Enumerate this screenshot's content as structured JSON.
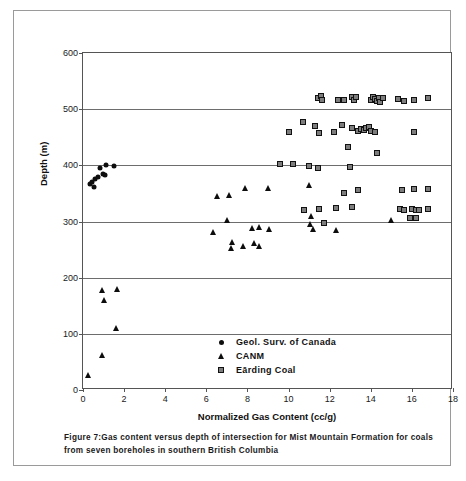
{
  "chart_data": {
    "type": "scatter",
    "title": "",
    "xlabel": "Normalized Gas Content (cc/g)",
    "ylabel": "Depth (m)",
    "xlim": [
      0,
      18
    ],
    "ylim": [
      0,
      600
    ],
    "xticks": [
      0,
      2,
      4,
      6,
      8,
      10,
      12,
      14,
      16,
      18
    ],
    "yticks": [
      0,
      100,
      200,
      300,
      400,
      500,
      600
    ],
    "grid": "horizontal",
    "legend_position": "inside-lower-center",
    "series": [
      {
        "name": "Geol. Surv. of Canada",
        "marker": "circle",
        "color": "#0d0d0d",
        "points": [
          [
            0.35,
            366
          ],
          [
            0.45,
            371
          ],
          [
            0.55,
            362
          ],
          [
            0.6,
            375
          ],
          [
            0.75,
            380
          ],
          [
            0.85,
            396
          ],
          [
            0.95,
            385
          ],
          [
            1.05,
            383
          ],
          [
            1.1,
            401
          ],
          [
            1.5,
            399
          ]
        ]
      },
      {
        "name": "CANM",
        "marker": "triangle",
        "color": "#0d0d0d",
        "points": [
          [
            0.25,
            27
          ],
          [
            0.9,
            62
          ],
          [
            0.9,
            178
          ],
          [
            1.0,
            161
          ],
          [
            1.65,
            180
          ],
          [
            1.6,
            110
          ],
          [
            6.5,
            346
          ],
          [
            6.3,
            282
          ],
          [
            7.1,
            347
          ],
          [
            7.0,
            302
          ],
          [
            7.2,
            253
          ],
          [
            7.25,
            263
          ],
          [
            7.9,
            360
          ],
          [
            7.8,
            256
          ],
          [
            8.2,
            289
          ],
          [
            8.3,
            262
          ],
          [
            8.55,
            290
          ],
          [
            8.55,
            256
          ],
          [
            9.0,
            360
          ],
          [
            9.05,
            286
          ],
          [
            11.0,
            365
          ],
          [
            11.1,
            310
          ],
          [
            11.05,
            296
          ],
          [
            11.2,
            286
          ],
          [
            12.3,
            285
          ],
          [
            15.0,
            303
          ]
        ]
      },
      {
        "name": "Eārding Coal",
        "marker": "square",
        "color": "#7d7d7d",
        "points": [
          [
            9.6,
            403
          ],
          [
            10.2,
            403
          ],
          [
            11.0,
            399
          ],
          [
            11.45,
            396
          ],
          [
            13.0,
            397
          ],
          [
            10.0,
            459
          ],
          [
            10.7,
            477
          ],
          [
            11.3,
            470
          ],
          [
            11.5,
            458
          ],
          [
            12.2,
            459
          ],
          [
            12.6,
            471
          ],
          [
            13.1,
            467
          ],
          [
            13.4,
            461
          ],
          [
            13.5,
            465
          ],
          [
            13.65,
            463
          ],
          [
            13.75,
            466
          ],
          [
            13.9,
            468
          ],
          [
            14.0,
            462
          ],
          [
            14.2,
            459
          ],
          [
            16.1,
            460
          ],
          [
            12.9,
            432
          ],
          [
            14.3,
            422
          ],
          [
            11.45,
            520
          ],
          [
            11.6,
            523
          ],
          [
            11.65,
            516
          ],
          [
            12.4,
            516
          ],
          [
            12.7,
            517
          ],
          [
            13.1,
            522
          ],
          [
            13.2,
            516
          ],
          [
            13.3,
            521
          ],
          [
            14.0,
            516
          ],
          [
            14.1,
            522
          ],
          [
            14.2,
            518
          ],
          [
            14.3,
            514
          ],
          [
            14.4,
            520
          ],
          [
            14.45,
            512
          ],
          [
            14.6,
            519
          ],
          [
            15.3,
            518
          ],
          [
            15.6,
            514
          ],
          [
            16.1,
            517
          ],
          [
            16.8,
            519
          ],
          [
            10.75,
            320
          ],
          [
            11.5,
            323
          ],
          [
            12.3,
            324
          ],
          [
            13.1,
            325
          ],
          [
            12.7,
            350
          ],
          [
            13.4,
            356
          ],
          [
            11.7,
            297
          ],
          [
            15.5,
            356
          ],
          [
            16.1,
            357
          ],
          [
            16.8,
            357
          ],
          [
            15.4,
            322
          ],
          [
            15.6,
            320
          ],
          [
            16.0,
            322
          ],
          [
            16.2,
            321
          ],
          [
            16.35,
            320
          ],
          [
            16.8,
            323
          ],
          [
            15.9,
            306
          ],
          [
            16.2,
            306
          ]
        ]
      }
    ],
    "caption": "Figure 7:Gas content versus depth of intersection for Mist Mountain Formation for coals from seven boreholes in southern British Columbia"
  }
}
